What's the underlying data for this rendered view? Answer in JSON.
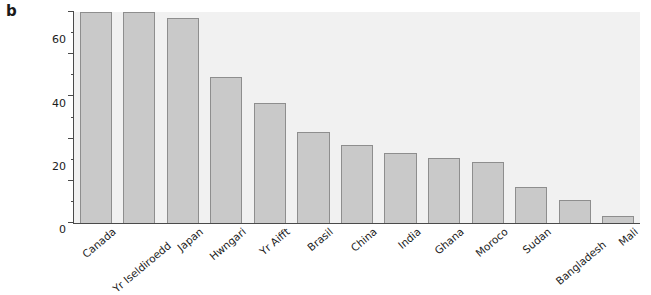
{
  "panel": {
    "label": "b"
  },
  "chart_data": {
    "type": "bar",
    "title": "",
    "subtitle": "",
    "xlabel": "",
    "ylabel": "Canran y merched\nmewn addysg\nuwchradd",
    "ylim": [
      0,
      100
    ],
    "ytick_labels": [
      "0",
      "20",
      "40",
      "60",
      "80",
      "100"
    ],
    "ytick_values": [
      0,
      20,
      40,
      60,
      80,
      100
    ],
    "yminor_values": [
      10,
      30,
      50,
      70,
      90
    ],
    "grid": false,
    "legend": null,
    "categories": [
      "Canada",
      "Yr Iseldiroedd",
      "Japan",
      "Hwngari",
      "Yr Aifft",
      "Brasil",
      "China",
      "India",
      "Ghana",
      "Moroco",
      "Sudan",
      "Bangladesh",
      "Mali"
    ],
    "values": [
      100,
      100,
      97,
      69,
      57,
      43,
      37,
      33,
      31,
      29,
      17,
      11,
      3.5
    ],
    "colors": {
      "bar_fill": "#c9c9c9",
      "bar_edge": "#8e8e8e",
      "plot_background": "#f1f1f1",
      "axis": "#4a4a4a",
      "text": "#1c1c1c",
      "figure_background": "#ffffff"
    }
  }
}
